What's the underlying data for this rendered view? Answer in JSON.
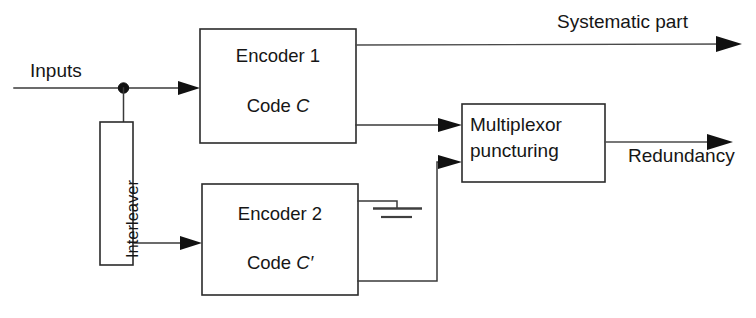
{
  "diagram": {
    "colors": {
      "background": "#ffffff",
      "line": "#3a3a3a",
      "box_stroke": "#2b2b2b",
      "text": "#161616"
    },
    "labels": {
      "inputs": "Inputs",
      "systematic_part": "Systematic part",
      "redundancy": "Redundancy",
      "interleaver": "Interleaver"
    },
    "blocks": [
      {
        "id": "encoder1",
        "name": "Encoder 1",
        "code_prefix": "Code ",
        "code_symbol": "C"
      },
      {
        "id": "encoder2",
        "name": "Encoder 2",
        "code_prefix": "Code ",
        "code_symbol": "C′"
      },
      {
        "id": "multiplexor",
        "line1": "Multiplexor",
        "line2": "puncturing"
      },
      {
        "id": "interleaver",
        "name": "Interleaver",
        "orientation": "vertical"
      }
    ],
    "signals": {
      "input_label": "Inputs",
      "output_top_label": "Systematic part",
      "output_bottom_label": "Redundancy"
    }
  }
}
